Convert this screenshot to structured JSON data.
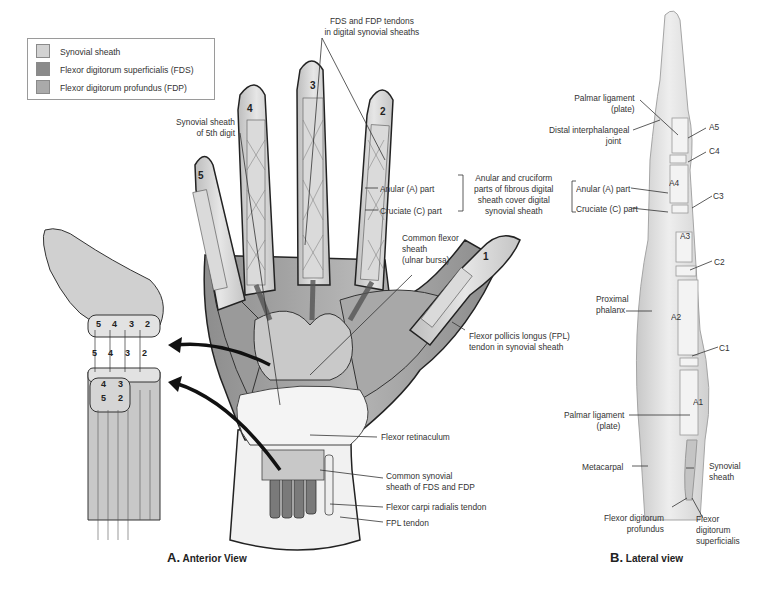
{
  "legend": {
    "items": [
      {
        "label": "Synovial sheath",
        "color": "#d2d2d2"
      },
      {
        "label": "Flexor digitorum superficialis (FDS)",
        "color": "#8a8a8a"
      },
      {
        "label": "Flexor digitorum profundus (FDP)",
        "color": "#aaaaaa"
      }
    ]
  },
  "anterior": {
    "caption_letter": "A.",
    "caption_text": "Anterior View",
    "digit_numbers": [
      "1",
      "2",
      "3",
      "4",
      "5"
    ],
    "labels": {
      "fds_fdp_line1": "FDS and FDP tendons",
      "fds_fdp_line2": "in digital synovial sheaths",
      "syn5_line1": "Synovial sheath",
      "syn5_line2": "of 5th digit",
      "anular_part": "Anular (A) part",
      "cruciate_part": "Cruciate (C) part",
      "bracket_line1": "Anular and cruciform",
      "bracket_line2": "parts of fibrous digital",
      "bracket_line3": "sheath cover digital",
      "bracket_line4": "synovial sheath",
      "common_flexor_line1": "Common flexor",
      "common_flexor_line2": "sheath",
      "common_flexor_line3": "(ulnar bursa)",
      "fpl_line1": "Flexor pollicis longus (FPL)",
      "fpl_line2": "tendon in synovial sheath",
      "flexor_retinaculum": "Flexor retinaculum",
      "common_syn_line1": "Common synovial",
      "common_syn_line2": "sheath of FDS and FDP",
      "fcr_tendon": "Flexor carpi radialis tendon",
      "fpl_tendon": "FPL tendon"
    },
    "cross_section_numbers": {
      "top_row": [
        "5",
        "4",
        "3",
        "2"
      ],
      "middle_row": [
        "5",
        "4",
        "3",
        "2"
      ],
      "bottom_upper": [
        "4",
        "3"
      ],
      "bottom_lower": [
        "5",
        "2"
      ]
    }
  },
  "lateral": {
    "caption_letter": "B.",
    "caption_text": "Lateral view",
    "labels": {
      "palmar_lig_top_line1": "Palmar ligament",
      "palmar_lig_top_line2": "(plate)",
      "dip_line1": "Distal interphalangeal",
      "dip_line2": "joint",
      "anular_part": "Anular (A) part",
      "cruciate_part": "Cruciate (C) part",
      "proximal_line1": "Proximal",
      "proximal_line2": "phalanx",
      "palmar_lig_bottom_line1": "Palmar ligament",
      "palmar_lig_bottom_line2": "(plate)",
      "metacarpal": "Metacarpal",
      "synovial_line1": "Synovial",
      "synovial_line2": "sheath",
      "fdp_line1": "Flexor digitorum",
      "fdp_line2": "profundus",
      "fds_line1": "Flexor",
      "fds_line2": "digitorum",
      "fds_line3": "superficialis"
    },
    "pulleys": [
      "A5",
      "C4",
      "A4",
      "C3",
      "A3",
      "C2",
      "A2",
      "C1",
      "A1"
    ]
  }
}
